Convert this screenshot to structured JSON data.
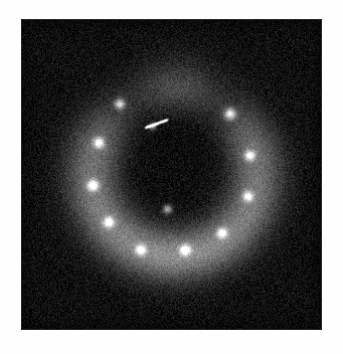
{
  "figure": {
    "panel": {
      "left": 21,
      "top": 19,
      "width": 301,
      "height": 311,
      "background_color": "#0b0b0b",
      "border_color": "#2b2b2b",
      "margin_color": "#ffffff"
    },
    "colormap": "grayscale",
    "noise": {
      "present": true,
      "description": "fine-grained speckle noise across entire panel",
      "amplitude": 26,
      "grain_scale": 1
    }
  },
  "chart_data": {
    "type": "heatmap",
    "title": "",
    "xlabel": "",
    "ylabel": "",
    "grid": false,
    "legend": "none",
    "xlim": [
      0,
      301
    ],
    "ylim": [
      0,
      311
    ],
    "colormap": "gray",
    "vmin": 0,
    "vmax": 255,
    "background_level": 16,
    "structures": [
      {
        "name": "diffuse-arc",
        "shape": "horseshoe",
        "description": "U-shaped diffuse emission ring open toward the top, surrounding a dark central cavity",
        "center_x": 153,
        "center_y": 155,
        "radius_outer": 112,
        "radius_inner": 54,
        "peak_level": 118,
        "gap_angle_start": -40,
        "gap_angle_end": 40
      },
      {
        "name": "central-cavity",
        "shape": "v-notch",
        "description": "dark low-intensity region at the center, wedge shaped opening upward",
        "center_x": 153,
        "center_y": 128,
        "width": 96,
        "height": 120,
        "level": 12
      },
      {
        "name": "top-blob",
        "shape": "diffuse-blob",
        "description": "soft diffuse clump above the cavity near the top center",
        "center_x": 155,
        "center_y": 75,
        "radius": 34,
        "peak_level": 72
      }
    ],
    "point_sources": [
      {
        "id": 1,
        "x": 98,
        "y": 84,
        "radius": 5.0,
        "peak_level": 168,
        "label": "src-01"
      },
      {
        "id": 2,
        "x": 209,
        "y": 94,
        "radius": 5.4,
        "peak_level": 186,
        "label": "src-02"
      },
      {
        "id": 3,
        "x": 77,
        "y": 123,
        "radius": 5.2,
        "peak_level": 178,
        "label": "src-03"
      },
      {
        "id": 4,
        "x": 229,
        "y": 136,
        "radius": 5.0,
        "peak_level": 176,
        "label": "src-04"
      },
      {
        "id": 5,
        "x": 71,
        "y": 166,
        "radius": 5.4,
        "peak_level": 188,
        "label": "src-05"
      },
      {
        "id": 6,
        "x": 227,
        "y": 177,
        "radius": 5.0,
        "peak_level": 174,
        "label": "src-06"
      },
      {
        "id": 7,
        "x": 87,
        "y": 203,
        "radius": 5.2,
        "peak_level": 182,
        "label": "src-07"
      },
      {
        "id": 8,
        "x": 201,
        "y": 214,
        "radius": 5.0,
        "peak_level": 172,
        "label": "src-08"
      },
      {
        "id": 9,
        "x": 119,
        "y": 231,
        "radius": 5.0,
        "peak_level": 178,
        "label": "src-09"
      },
      {
        "id": 10,
        "x": 164,
        "y": 231,
        "radius": 5.2,
        "peak_level": 180,
        "label": "src-10"
      },
      {
        "id": 11,
        "x": 146,
        "y": 190,
        "radius": 4.2,
        "peak_level": 150,
        "label": "src-11"
      },
      {
        "id": 12,
        "x": 131,
        "y": 107,
        "radius": 3.4,
        "peak_level": 120,
        "label": "src-12"
      }
    ],
    "streaks": [
      {
        "name": "thin-streak",
        "x1": 124,
        "y1": 108,
        "x2": 146,
        "y2": 100,
        "level": 128
      }
    ]
  }
}
